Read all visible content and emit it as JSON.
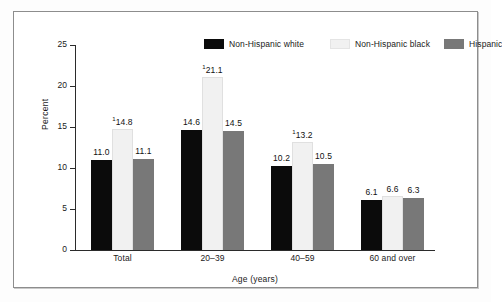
{
  "chart_data": {
    "type": "bar",
    "title": "",
    "xlabel": "Age (years)",
    "ylabel": "Percent",
    "ylim": [
      0,
      25
    ],
    "yticks": [
      "0",
      "5",
      "10",
      "15",
      "20",
      "25"
    ],
    "ytick_values": [
      0,
      5,
      10,
      15,
      20,
      25
    ],
    "grid": false,
    "legend_position": "top",
    "categories": [
      "Total",
      "20–39",
      "40–59",
      "60 and over"
    ],
    "series": [
      {
        "name": "Non-Hispanic white",
        "color": "#0b0b0b",
        "values": [
          11.0,
          14.6,
          10.2,
          6.1
        ],
        "labels": [
          "11.0",
          "14.6",
          "10.2",
          "6.1"
        ],
        "footnote_marks": [
          "",
          "",
          "",
          ""
        ]
      },
      {
        "name": "Non-Hispanic black",
        "color": "#f1f1f1",
        "values": [
          14.8,
          21.1,
          13.2,
          6.6
        ],
        "labels": [
          "14.8",
          "21.1",
          "13.2",
          "6.6"
        ],
        "footnote_marks": [
          "1",
          "1",
          "1",
          ""
        ]
      },
      {
        "name": "Hispanic",
        "color": "#787878",
        "values": [
          11.1,
          14.5,
          10.5,
          6.3
        ],
        "labels": [
          "11.1",
          "14.5",
          "10.5",
          "6.3"
        ],
        "footnote_marks": [
          "",
          "",
          "",
          ""
        ]
      }
    ]
  },
  "legend": {
    "entries": [
      {
        "label": "Non-Hispanic white",
        "color": "#0b0b0b"
      },
      {
        "label": "Non-Hispanic black",
        "color": "#f1f1f1"
      },
      {
        "label": "Hispanic",
        "color": "#787878"
      }
    ]
  },
  "axes": {
    "y_title": "Percent",
    "x_title": "Age (years)",
    "y_tick_labels": [
      "25",
      "20",
      "15",
      "10",
      "5",
      "0"
    ],
    "x_tick_labels": [
      "Total",
      "20–39",
      "40–59",
      "60 and over"
    ]
  },
  "colors": {
    "series_1": "#0b0b0b",
    "series_2": "#f1f1f1",
    "series_3": "#787878",
    "axis": "#2b2b2b",
    "frame": "#8d8d8d",
    "background": "#ffffff"
  }
}
